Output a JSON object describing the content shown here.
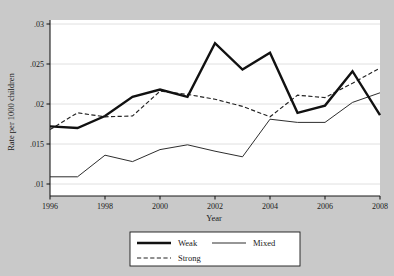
{
  "chart_data": {
    "type": "line",
    "title": "",
    "xlabel": "Year",
    "ylabel": "Rate per 1000 children",
    "x": [
      1996,
      1997,
      1998,
      1999,
      2000,
      2001,
      2002,
      2003,
      2004,
      2005,
      2006,
      2007,
      2008
    ],
    "xlim": [
      1996,
      2008
    ],
    "ylim": [
      0.0085,
      0.0305
    ],
    "xticks": [
      1996,
      1998,
      2000,
      2002,
      2004,
      2006,
      2008
    ],
    "xtick_labels": [
      "1996",
      "1998",
      "2000",
      "2002",
      "2004",
      "2006",
      "2008"
    ],
    "yticks": [
      0.01,
      0.015,
      0.02,
      0.025,
      0.03
    ],
    "ytick_labels": [
      ".01",
      ".015",
      ".02",
      ".025",
      ".03"
    ],
    "grid": "horizontal",
    "legend_position": "bottom-center",
    "series": [
      {
        "name": "Weak",
        "style": "solid-thick",
        "color": "#111111",
        "values": [
          0.0172,
          0.017,
          0.0185,
          0.0209,
          0.0218,
          0.0209,
          0.0276,
          0.0243,
          0.0264,
          0.0189,
          0.0198,
          0.0241,
          0.0186
        ]
      },
      {
        "name": "Mixed",
        "style": "solid-thin",
        "color": "#222222",
        "values": [
          0.0109,
          0.0109,
          0.0136,
          0.0128,
          0.0143,
          0.0149,
          0.0141,
          0.0134,
          0.0181,
          0.0177,
          0.0177,
          0.0202,
          0.0214
        ]
      },
      {
        "name": "Strong",
        "style": "dashed",
        "color": "#222222",
        "values": [
          0.0168,
          0.0189,
          0.0184,
          0.0185,
          0.0216,
          0.0212,
          0.0206,
          0.0197,
          0.0184,
          0.0211,
          0.0208,
          0.0226,
          0.0245
        ]
      }
    ]
  },
  "figure": {
    "background_color": "#c9c9c9",
    "plot_background_color": "#ffffff",
    "axis_color": "#1a1a1a",
    "grid_color": "#d8d8d8"
  },
  "legend": {
    "items": [
      {
        "label": "Weak"
      },
      {
        "label": "Mixed"
      },
      {
        "label": "Strong"
      }
    ]
  }
}
